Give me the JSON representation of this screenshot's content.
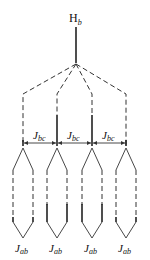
{
  "diagram": {
    "root_label": {
      "main": "H",
      "sub": "b"
    },
    "coupling_bc_label": {
      "main": "J",
      "sub": "bc"
    },
    "coupling_ab_label": {
      "main": "J",
      "sub": "ab"
    },
    "branches": [
      {
        "x": 23,
        "bc_label": "J",
        "bc_sub": "bc",
        "ab_label": "J",
        "ab_sub": "ab"
      },
      {
        "x": 57,
        "bc_label": "J",
        "bc_sub": "bc",
        "ab_label": "J",
        "ab_sub": "ab"
      },
      {
        "x": 92,
        "bc_label": "J",
        "bc_sub": "bc",
        "ab_label": "J",
        "ab_sub": "ab"
      },
      {
        "x": 126,
        "ab_label": "J",
        "ab_sub": "ab"
      }
    ],
    "bc_arrows_count": 3,
    "ab_labels_count": 4
  }
}
